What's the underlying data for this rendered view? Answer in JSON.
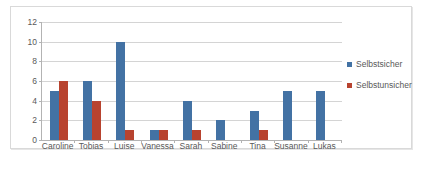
{
  "chart_data": {
    "type": "bar",
    "title": "",
    "xlabel": "",
    "ylabel": "",
    "categories": [
      "Caroline",
      "Tobias",
      "Luise",
      "Vanessa",
      "Sarah",
      "Sabine",
      "Tina",
      "Susanne",
      "Lukas"
    ],
    "series": [
      {
        "name": "Selbstsicher",
        "color": "#4372a4",
        "values": [
          5,
          6,
          10,
          1,
          4,
          2,
          3,
          5,
          5
        ]
      },
      {
        "name": "Selbstunsicher",
        "color": "#b8432f",
        "values": [
          6,
          4,
          1,
          1,
          1,
          0,
          1,
          0,
          0
        ]
      }
    ],
    "ylim": [
      0,
      12
    ],
    "yticks": [
      12,
      10,
      8,
      6,
      4,
      2,
      0
    ],
    "ytick_labels": [
      "12",
      "10",
      "8",
      "6",
      "4",
      "2",
      "0"
    ],
    "grid": true,
    "legend_position": "right"
  },
  "legend": {
    "items": [
      {
        "label": "Selbstsicher",
        "color": "#4372a4"
      },
      {
        "label": "Selbstunsicher",
        "color": "#b8432f"
      }
    ]
  }
}
